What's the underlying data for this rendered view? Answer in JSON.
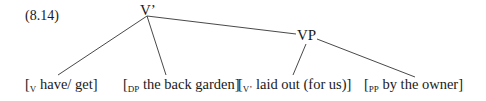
{
  "example_number": "(8.14)",
  "nodes": {
    "root": "V’",
    "vp": "VP"
  },
  "leaves": [
    {
      "label": "V",
      "open": "[",
      "text": " have/ get]"
    },
    {
      "label": "DP",
      "open": "[",
      "text": " the back garden]"
    },
    {
      "label": "V’",
      "open": "[",
      "text": " laid out (for us)]"
    },
    {
      "label": "PP",
      "open": "[",
      "text": " by the owner]"
    }
  ]
}
